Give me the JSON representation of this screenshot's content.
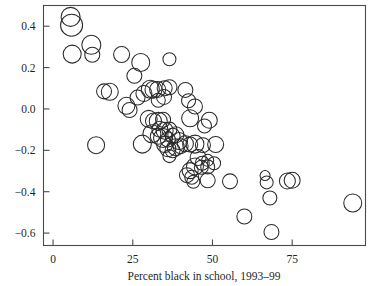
{
  "chart_data": {
    "type": "scatter",
    "title": "",
    "subtitle": "",
    "xlabel": "Percent black in school, 1993–99",
    "ylabel": "",
    "xlim": [
      -3,
      98
    ],
    "ylim": [
      -0.66,
      0.5
    ],
    "grid": false,
    "legend": null,
    "marker": "open-circle",
    "marker_size_encodes": "weight",
    "xticks": [
      0,
      25,
      50,
      75
    ],
    "xticklabels": [
      "0",
      "25",
      "50",
      "75"
    ],
    "yticks": [
      0.4,
      0.2,
      0.0,
      -0.2,
      -0.4,
      -0.6
    ],
    "yticklabels": [
      "0.4",
      "0.2",
      "0.0",
      "−0.2",
      "−0.4",
      "−0.6"
    ],
    "colors": {
      "marker_stroke": "#2b2b2b",
      "axis": "#4a4a4a",
      "text": "#1f1f1f",
      "background": "#ffffff"
    },
    "points": [
      {
        "x": 5.5,
        "y": 0.445,
        "r": 9.5
      },
      {
        "x": 5.8,
        "y": 0.405,
        "r": 11.0
      },
      {
        "x": 6.0,
        "y": 0.265,
        "r": 9.0
      },
      {
        "x": 12.0,
        "y": 0.31,
        "r": 9.5
      },
      {
        "x": 12.3,
        "y": 0.262,
        "r": 7.5
      },
      {
        "x": 21.5,
        "y": 0.263,
        "r": 8.0
      },
      {
        "x": 16.0,
        "y": 0.085,
        "r": 7.5
      },
      {
        "x": 17.8,
        "y": 0.083,
        "r": 8.5
      },
      {
        "x": 13.5,
        "y": -0.175,
        "r": 8.5
      },
      {
        "x": 27.5,
        "y": 0.225,
        "r": 9.0
      },
      {
        "x": 36.5,
        "y": 0.24,
        "r": 6.5
      },
      {
        "x": 25.5,
        "y": 0.16,
        "r": 7.5
      },
      {
        "x": 23.0,
        "y": 0.015,
        "r": 8.5
      },
      {
        "x": 24.0,
        "y": -0.005,
        "r": 7.5
      },
      {
        "x": 26.5,
        "y": 0.055,
        "r": 7.5
      },
      {
        "x": 28.5,
        "y": 0.075,
        "r": 8.0
      },
      {
        "x": 30.5,
        "y": 0.095,
        "r": 9.0
      },
      {
        "x": 31.5,
        "y": 0.093,
        "r": 8.5
      },
      {
        "x": 32.8,
        "y": 0.094,
        "r": 8.0
      },
      {
        "x": 33.0,
        "y": 0.042,
        "r": 7.0
      },
      {
        "x": 35.0,
        "y": 0.1,
        "r": 7.5
      },
      {
        "x": 36.5,
        "y": 0.105,
        "r": 7.5
      },
      {
        "x": 34.8,
        "y": 0.058,
        "r": 7.5
      },
      {
        "x": 30.0,
        "y": -0.048,
        "r": 8.5
      },
      {
        "x": 31.5,
        "y": -0.058,
        "r": 8.0
      },
      {
        "x": 33.0,
        "y": -0.06,
        "r": 9.0
      },
      {
        "x": 34.5,
        "y": -0.052,
        "r": 7.5
      },
      {
        "x": 33.5,
        "y": -0.098,
        "r": 8.0
      },
      {
        "x": 35.0,
        "y": -0.105,
        "r": 8.5
      },
      {
        "x": 36.5,
        "y": -0.1,
        "r": 7.5
      },
      {
        "x": 31.0,
        "y": -0.12,
        "r": 9.0
      },
      {
        "x": 33.0,
        "y": -0.132,
        "r": 8.0
      },
      {
        "x": 34.5,
        "y": -0.14,
        "r": 9.5
      },
      {
        "x": 36.0,
        "y": -0.148,
        "r": 7.5
      },
      {
        "x": 37.5,
        "y": -0.13,
        "r": 7.5
      },
      {
        "x": 38.5,
        "y": -0.125,
        "r": 8.0
      },
      {
        "x": 39.5,
        "y": -0.155,
        "r": 8.5
      },
      {
        "x": 36.0,
        "y": -0.192,
        "r": 8.0
      },
      {
        "x": 37.5,
        "y": -0.2,
        "r": 7.5
      },
      {
        "x": 38.5,
        "y": -0.185,
        "r": 8.5
      },
      {
        "x": 40.0,
        "y": -0.18,
        "r": 7.5
      },
      {
        "x": 41.5,
        "y": -0.168,
        "r": 8.0
      },
      {
        "x": 43.0,
        "y": -0.172,
        "r": 7.5
      },
      {
        "x": 44.5,
        "y": -0.17,
        "r": 9.0
      },
      {
        "x": 28.0,
        "y": -0.17,
        "r": 9.0
      },
      {
        "x": 35.0,
        "y": -0.172,
        "r": 8.0
      },
      {
        "x": 36.5,
        "y": -0.228,
        "r": 6.5
      },
      {
        "x": 42.0,
        "y": -0.32,
        "r": 7.5
      },
      {
        "x": 43.5,
        "y": -0.33,
        "r": 7.0
      },
      {
        "x": 44.0,
        "y": -0.352,
        "r": 6.5
      },
      {
        "x": 47.0,
        "y": -0.175,
        "r": 7.5
      },
      {
        "x": 51.0,
        "y": -0.172,
        "r": 8.0
      },
      {
        "x": 45.5,
        "y": -0.235,
        "r": 8.0
      },
      {
        "x": 46.8,
        "y": -0.262,
        "r": 7.0
      },
      {
        "x": 48.5,
        "y": -0.248,
        "r": 6.0
      },
      {
        "x": 44.5,
        "y": -0.278,
        "r": 8.5
      },
      {
        "x": 46.5,
        "y": -0.282,
        "r": 7.0
      },
      {
        "x": 48.5,
        "y": -0.28,
        "r": 7.0
      },
      {
        "x": 50.5,
        "y": -0.262,
        "r": 6.5
      },
      {
        "x": 43.0,
        "y": -0.298,
        "r": 8.0
      },
      {
        "x": 48.5,
        "y": -0.345,
        "r": 7.5
      },
      {
        "x": 55.5,
        "y": -0.35,
        "r": 7.5
      },
      {
        "x": 66.5,
        "y": -0.322,
        "r": 5.0
      },
      {
        "x": 67.0,
        "y": -0.355,
        "r": 6.5
      },
      {
        "x": 73.5,
        "y": -0.348,
        "r": 8.0
      },
      {
        "x": 75.0,
        "y": -0.345,
        "r": 8.0
      },
      {
        "x": 68.0,
        "y": -0.43,
        "r": 7.0
      },
      {
        "x": 60.0,
        "y": -0.52,
        "r": 7.5
      },
      {
        "x": 68.5,
        "y": -0.595,
        "r": 7.5
      },
      {
        "x": 94.0,
        "y": -0.455,
        "r": 9.0
      },
      {
        "x": 47.5,
        "y": -0.082,
        "r": 7.0
      },
      {
        "x": 49.0,
        "y": -0.055,
        "r": 8.0
      },
      {
        "x": 43.0,
        "y": -0.045,
        "r": 8.5
      },
      {
        "x": 44.5,
        "y": 0.012,
        "r": 7.5
      },
      {
        "x": 41.5,
        "y": 0.092,
        "r": 7.5
      },
      {
        "x": 42.5,
        "y": 0.04,
        "r": 7.0
      }
    ]
  },
  "axes": {
    "x_label": "Percent black in school, 1993–99",
    "x_tick_labels": [
      "0",
      "25",
      "50",
      "75"
    ],
    "y_tick_labels": [
      "0.4",
      "0.2",
      "0.0",
      "−0.2",
      "−0.4",
      "−0.6"
    ]
  }
}
